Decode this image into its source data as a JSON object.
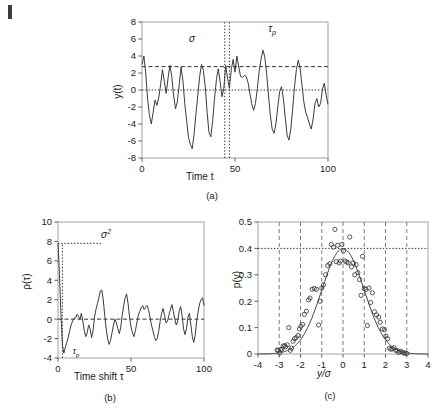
{
  "figure": {
    "panels": [
      {
        "id": "a",
        "caption": "(a)",
        "xlabel": "Time t",
        "ylabel": "y(t)",
        "annotations": [
          {
            "name": "sigma-label",
            "text": "σ"
          },
          {
            "name": "tau-p-label",
            "text": "τp"
          }
        ]
      },
      {
        "id": "b",
        "caption": "(b)",
        "xlabel": "Time shift τ",
        "ylabel": "ρ(τ)",
        "annotations": [
          {
            "name": "sigma-squared-label",
            "text": "σ²"
          },
          {
            "name": "tau-p-label",
            "text": "τp"
          }
        ]
      },
      {
        "id": "c",
        "caption": "(c)",
        "xlabel": "y/σ",
        "ylabel": "p(y)"
      }
    ]
  },
  "chart_data": [
    {
      "type": "line",
      "panel": "a",
      "title": "",
      "xlabel": "Time t",
      "ylabel": "y(t)",
      "xlim": [
        0,
        100
      ],
      "ylim": [
        -8,
        8
      ],
      "xticks": [
        0,
        50,
        100
      ],
      "yticks": [
        -8,
        -6,
        -4,
        -2,
        0,
        2,
        4,
        6,
        8
      ],
      "grid": false,
      "reference_lines": [
        {
          "name": "sigma-line",
          "orientation": "horizontal",
          "value": 2.75,
          "style": "dashed",
          "label": "σ"
        },
        {
          "name": "zero-line",
          "orientation": "horizontal",
          "value": 0,
          "style": "dotted",
          "label": ""
        },
        {
          "name": "tau-p-left",
          "orientation": "vertical",
          "value": 44.5,
          "style": "dotted",
          "label": ""
        },
        {
          "name": "tau-p-right",
          "orientation": "vertical",
          "value": 47.0,
          "style": "dotted",
          "label": "τp"
        }
      ],
      "x": [
        0,
        1,
        2,
        3,
        4,
        5,
        6,
        7,
        8,
        9,
        10,
        11,
        12,
        13,
        14,
        15,
        16,
        17,
        18,
        19,
        20,
        21,
        22,
        23,
        24,
        25,
        26,
        27,
        28,
        29,
        30,
        31,
        32,
        33,
        34,
        35,
        36,
        37,
        38,
        39,
        40,
        41,
        42,
        43,
        44,
        45,
        46,
        47,
        48,
        49,
        50,
        51,
        52,
        53,
        54,
        55,
        56,
        57,
        58,
        59,
        60,
        61,
        62,
        63,
        64,
        65,
        66,
        67,
        68,
        69,
        70,
        71,
        72,
        73,
        74,
        75,
        76,
        77,
        78,
        79,
        80,
        81,
        82,
        83,
        84,
        85,
        86,
        87,
        88,
        89,
        90,
        91,
        92,
        93,
        94,
        95,
        96,
        97,
        98,
        99,
        100
      ],
      "values": [
        3.0,
        4.0,
        2.0,
        -1.0,
        -3.0,
        -4.0,
        -2.6,
        -1.2,
        -1.8,
        -0.9,
        0.6,
        2.4,
        1.0,
        -0.4,
        1.4,
        2.9,
        1.6,
        -0.6,
        -2.2,
        -1.4,
        0.6,
        2.7,
        1.1,
        -1.6,
        -3.6,
        -5.6,
        -6.4,
        -6.9,
        -5.2,
        -2.8,
        -0.6,
        1.6,
        3.0,
        2.3,
        0.4,
        -2.6,
        -5.0,
        -5.5,
        -3.6,
        -1.0,
        1.2,
        2.5,
        1.0,
        -0.8,
        0.2,
        2.9,
        1.4,
        0.2,
        2.4,
        3.6,
        2.1,
        4.0,
        2.7,
        1.6,
        1.5,
        1.7,
        1.6,
        0.9,
        -0.4,
        -1.6,
        -2.4,
        -1.6,
        0.2,
        2.2,
        3.6,
        4.7,
        3.9,
        2.0,
        -0.6,
        -3.0,
        -4.6,
        -5.1,
        -4.0,
        -2.0,
        -0.2,
        0.4,
        -1.0,
        -3.2,
        -5.3,
        -5.9,
        -4.6,
        -2.2,
        0.4,
        2.4,
        3.5,
        2.6,
        0.6,
        -1.4,
        -2.6,
        -3.2,
        -4.0,
        -4.6,
        -3.4,
        -1.6,
        -1.0,
        -2.0,
        -1.6,
        0.0,
        0.8,
        -0.6,
        -1.7,
        0.2
      ]
    },
    {
      "type": "line",
      "panel": "b",
      "title": "",
      "xlabel": "Time shift τ",
      "ylabel": "ρ(τ)",
      "xlim": [
        0,
        100
      ],
      "ylim": [
        -4,
        10
      ],
      "xticks": [
        0,
        50,
        100
      ],
      "yticks": [
        -4,
        -2,
        0,
        2,
        4,
        6,
        8,
        10
      ],
      "grid": false,
      "reference_lines": [
        {
          "name": "sigma-squared-line",
          "orientation": "horizontal",
          "value": 7.8,
          "style": "dotted",
          "label": "σ²",
          "x_extent": [
            0,
            30
          ]
        },
        {
          "name": "zero-line",
          "orientation": "horizontal",
          "value": 0,
          "style": "dashed",
          "label": ""
        },
        {
          "name": "tau-p-line",
          "orientation": "vertical",
          "value": 3.0,
          "style": "dotted",
          "label": "τp",
          "y_extent": [
            -4,
            7.8
          ]
        }
      ],
      "x": [
        0,
        1,
        2,
        3,
        4,
        5,
        6,
        7,
        8,
        9,
        10,
        11,
        12,
        13,
        14,
        15,
        16,
        17,
        18,
        19,
        20,
        21,
        22,
        23,
        24,
        25,
        26,
        27,
        28,
        29,
        30,
        31,
        32,
        33,
        34,
        35,
        36,
        37,
        38,
        39,
        40,
        41,
        42,
        43,
        44,
        45,
        46,
        47,
        48,
        49,
        50,
        51,
        52,
        53,
        54,
        55,
        56,
        57,
        58,
        59,
        60,
        61,
        62,
        63,
        64,
        65,
        66,
        67,
        68,
        69,
        70,
        71,
        72,
        73,
        74,
        75,
        76,
        77,
        78,
        79,
        80,
        81,
        82,
        83,
        84,
        85,
        86,
        87,
        88,
        89,
        90,
        91,
        92,
        93,
        94,
        95,
        96,
        97,
        98,
        99,
        100
      ],
      "values": [
        7.8,
        4.6,
        0.6,
        -2.6,
        -3.5,
        -2.9,
        -2.4,
        -1.9,
        -1.2,
        -0.6,
        -0.2,
        0.1,
        0.1,
        0.5,
        0.3,
        0.0,
        0.6,
        -0.2,
        -1.2,
        -1.8,
        -1.4,
        -0.6,
        -1.0,
        -1.9,
        -1.2,
        0.2,
        1.0,
        1.6,
        2.2,
        2.9,
        3.0,
        2.0,
        0.4,
        -1.0,
        -2.0,
        -2.6,
        -2.2,
        -1.4,
        -0.6,
        0.0,
        -0.4,
        -1.0,
        -1.5,
        -0.8,
        0.4,
        1.4,
        2.2,
        2.6,
        1.6,
        0.2,
        -0.8,
        -1.4,
        -1.8,
        -1.2,
        -0.4,
        0.4,
        0.8,
        1.2,
        1.4,
        1.0,
        1.2,
        1.4,
        1.0,
        0.2,
        -0.6,
        -1.2,
        -1.8,
        -2.2,
        -2.0,
        -1.2,
        -0.2,
        0.6,
        1.1,
        0.4,
        -0.4,
        -0.2,
        0.4,
        1.0,
        1.5,
        0.8,
        0.0,
        -0.6,
        -0.2,
        0.8,
        1.3,
        0.4,
        -1.0,
        -1.6,
        -1.0,
        0.2,
        0.6,
        -0.6,
        -1.8,
        -2.4,
        -1.6,
        -0.2,
        0.8,
        1.6,
        2.0,
        2.2,
        1.4,
        0.3
      ]
    },
    {
      "type": "scatter",
      "panel": "c",
      "title": "",
      "xlabel": "y/σ",
      "ylabel": "p(y)",
      "xlim": [
        -4,
        4
      ],
      "ylim": [
        0,
        0.5
      ],
      "xticks": [
        -4,
        -3,
        -2,
        -1,
        0,
        1,
        2,
        3,
        4
      ],
      "yticks": [
        0,
        0.1,
        0.2,
        0.3,
        0.4,
        0.5
      ],
      "grid": true,
      "gridlines_vertical": [
        -3,
        -2,
        -1,
        0,
        1,
        2,
        3
      ],
      "reference_lines": [
        {
          "name": "peak-line",
          "orientation": "horizontal",
          "value": 0.4,
          "style": "dotted",
          "label": ""
        }
      ],
      "series": [
        {
          "name": "gaussian-fit",
          "type": "line",
          "mean": 0,
          "sigma": 1,
          "peak": 0.399
        },
        {
          "name": "measured-histogram",
          "type": "scatter",
          "marker": "open-circle",
          "points": [
            [
              -3.1,
              0.015
            ],
            [
              -3.05,
              0.014
            ],
            [
              -2.98,
              0.004
            ],
            [
              -2.95,
              0.016
            ],
            [
              -2.88,
              0.018
            ],
            [
              -2.82,
              0.03
            ],
            [
              -2.75,
              0.032
            ],
            [
              -2.7,
              0.027
            ],
            [
              -2.62,
              0.035
            ],
            [
              -2.55,
              0.1
            ],
            [
              -2.48,
              0.014
            ],
            [
              -2.42,
              0.022
            ],
            [
              -2.35,
              0.048
            ],
            [
              -2.28,
              0.058
            ],
            [
              -2.2,
              0.062
            ],
            [
              -2.12,
              0.07
            ],
            [
              -2.05,
              0.095
            ],
            [
              -1.98,
              0.105
            ],
            [
              -1.9,
              0.112
            ],
            [
              -1.82,
              0.15
            ],
            [
              -1.72,
              0.162
            ],
            [
              -1.62,
              0.205
            ],
            [
              -1.55,
              0.212
            ],
            [
              -1.45,
              0.245
            ],
            [
              -1.35,
              0.248
            ],
            [
              -1.25,
              0.245
            ],
            [
              -1.15,
              0.11
            ],
            [
              -1.08,
              0.2
            ],
            [
              -1.0,
              0.25
            ],
            [
              -0.92,
              0.262
            ],
            [
              -0.82,
              0.3
            ],
            [
              -0.72,
              0.335
            ],
            [
              -0.62,
              0.342
            ],
            [
              -0.55,
              0.415
            ],
            [
              -0.45,
              0.405
            ],
            [
              -0.38,
              0.472
            ],
            [
              -0.32,
              0.35
            ],
            [
              -0.25,
              0.412
            ],
            [
              -0.18,
              0.345
            ],
            [
              -0.12,
              0.352
            ],
            [
              -0.05,
              0.415
            ],
            [
              0.02,
              0.39
            ],
            [
              0.1,
              0.352
            ],
            [
              0.18,
              0.348
            ],
            [
              0.25,
              0.345
            ],
            [
              0.32,
              0.443
            ],
            [
              0.4,
              0.33
            ],
            [
              0.48,
              0.345
            ],
            [
              0.55,
              0.3
            ],
            [
              0.62,
              0.338
            ],
            [
              0.7,
              0.308
            ],
            [
              0.78,
              0.282
            ],
            [
              0.85,
              0.222
            ],
            [
              0.92,
              0.37
            ],
            [
              1.0,
              0.248
            ],
            [
              1.08,
              0.245
            ],
            [
              1.15,
              0.108
            ],
            [
              1.22,
              0.25
            ],
            [
              1.3,
              0.195
            ],
            [
              1.38,
              0.232
            ],
            [
              1.48,
              0.16
            ],
            [
              1.58,
              0.148
            ],
            [
              1.68,
              0.14
            ],
            [
              1.75,
              0.12
            ],
            [
              1.85,
              0.095
            ],
            [
              1.95,
              0.092
            ],
            [
              2.02,
              0.068
            ],
            [
              2.1,
              0.058
            ],
            [
              2.18,
              0.022
            ],
            [
              2.25,
              0.018
            ],
            [
              2.32,
              0.02
            ],
            [
              2.4,
              0.024
            ],
            [
              2.48,
              0.014
            ],
            [
              2.55,
              0.012
            ],
            [
              2.62,
              0.006
            ],
            [
              2.7,
              0.01
            ],
            [
              2.78,
              0.008
            ],
            [
              2.85,
              0.004
            ],
            [
              2.92,
              0.003
            ],
            [
              3.0,
              0.002
            ]
          ]
        }
      ]
    }
  ]
}
